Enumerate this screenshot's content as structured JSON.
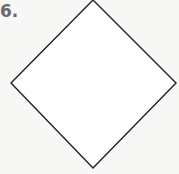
{
  "problem": {
    "number_label": "6.",
    "shape": {
      "type": "rhombus",
      "vertices": {
        "top": [
          93,
          0
        ],
        "right": [
          176,
          83
        ],
        "bottom": [
          93,
          168
        ],
        "left": [
          11,
          83
        ]
      },
      "stroke_color": "#222222",
      "fill_color": "#ffffff"
    }
  }
}
